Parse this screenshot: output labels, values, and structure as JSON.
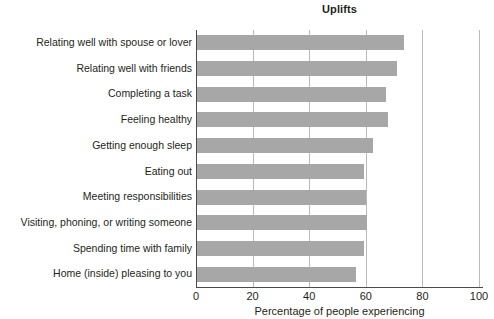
{
  "chart_data": {
    "type": "bar",
    "orientation": "horizontal",
    "title": "Uplifts",
    "xlabel": "Percentage of people experiencing",
    "ylabel": "",
    "xlim": [
      0,
      100
    ],
    "xticks": [
      0,
      20,
      40,
      60,
      80,
      100
    ],
    "grid": "vertical",
    "legend": "none",
    "bar_color": "#a7a7a7",
    "axis_color": "#4a4a4a",
    "gridline_color": "#b9b9b9",
    "categories": [
      "Relating well with spouse or lover",
      "Relating well with friends",
      "Completing a task",
      "Feeling healthy",
      "Getting enough sleep",
      "Eating out",
      "Meeting responsibilities",
      "Visiting, phoning, or writing someone",
      "Spending time with family",
      "Home (inside) pleasing to you"
    ],
    "values": [
      73.5,
      71,
      67,
      68,
      62.5,
      59.5,
      60,
      60.5,
      59.4,
      56.5
    ]
  }
}
